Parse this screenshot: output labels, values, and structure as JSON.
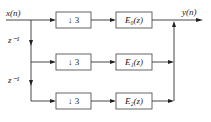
{
  "diagram": {
    "input_label": "x(n)",
    "output_label": "y(n)",
    "delay_labels": [
      "z⁻¹",
      "z⁻¹"
    ],
    "rows": [
      {
        "downsampler": "↓ 3",
        "filter": "E₀(z)"
      },
      {
        "downsampler": "↓ 3",
        "filter": "E₁(z)"
      },
      {
        "downsampler": "↓ 3",
        "filter": "E₂(z)"
      }
    ]
  }
}
